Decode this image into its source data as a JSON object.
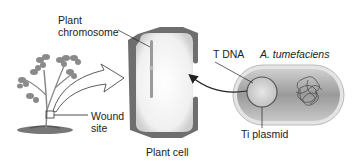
{
  "diagram": {
    "labels": {
      "plant_chromosome_line1": "Plant",
      "plant_chromosome_line2": "chromosome",
      "wound_line1": "Wound",
      "wound_line2": "site",
      "plant_cell": "Plant cell",
      "t_dna": "T DNA",
      "bacterium": "A. tumefaciens",
      "ti_plasmid": "Ti plasmid"
    },
    "colors": {
      "cell_wall": "#6e6e6e",
      "cell_interior": "#f2f2f2",
      "bacterium_fill": "#a8a8a8",
      "leaf": "#8a8a8a",
      "line": "#222222"
    }
  }
}
